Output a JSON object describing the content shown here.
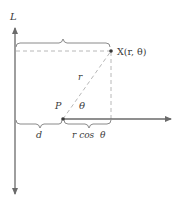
{
  "diagram": {
    "type": "geometry",
    "axis_label": "L",
    "point_x_label": "X(r, θ)",
    "point_p_label": "P",
    "segment_r_label": "r",
    "angle_label": "θ",
    "distance_d_label": "d",
    "projection_label": "r cos  θ",
    "colors": {
      "axis": "#6a6a6a",
      "dashed": "#b0b0b0",
      "brace": "#8a8a8a",
      "point": "#3a3a3a",
      "text": "#3a3a3a"
    }
  }
}
